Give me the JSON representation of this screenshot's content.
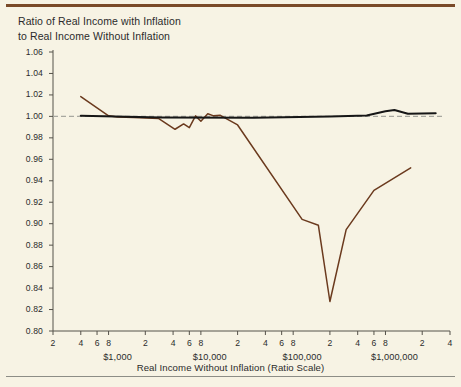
{
  "figure": {
    "title_line1": "Ratio of Real Income with Inflation",
    "title_line2": "to Real Income Without Inflation",
    "xaxis_title": "Real Income Without Inflation (Ratio Scale)",
    "top_rule_color": "#7a4a28",
    "bottom_rule_color": "#8d8d86",
    "background_color": "#f7f3e4"
  },
  "chart_data": {
    "type": "line",
    "title": "Ratio of Real Income with Inflation to Real Income Without Inflation",
    "xlabel": "Real Income Without Inflation (Ratio Scale)",
    "ylabel": "",
    "xscale": "log",
    "xlim": [
      200,
      4000000
    ],
    "ylim": [
      0.8,
      1.06
    ],
    "ygrid": false,
    "yticks": [
      "1.06",
      "1.04",
      "1.02",
      "1.00",
      "0.98",
      "0.96",
      "0.94",
      "0.92",
      "0.90",
      "0.88",
      "0.86",
      "0.84",
      "0.82",
      "0.80"
    ],
    "ytick_values": [
      1.06,
      1.04,
      1.02,
      1.0,
      0.98,
      0.96,
      0.94,
      0.92,
      0.9,
      0.88,
      0.86,
      0.84,
      0.82,
      0.8
    ],
    "xtick_labels": [
      "2",
      "4",
      "6",
      "8",
      "2",
      "4",
      "6",
      "8",
      "2",
      "4",
      "6",
      "8",
      "2",
      "4",
      "6",
      "8",
      "2",
      "4"
    ],
    "xtick_values": [
      200,
      400,
      600,
      800,
      2000,
      4000,
      6000,
      8000,
      20000,
      40000,
      60000,
      80000,
      200000,
      400000,
      600000,
      800000,
      2000000,
      4000000
    ],
    "decade_labels": [
      {
        "text": "$1,000",
        "value": 1000
      },
      {
        "text": "$10,000",
        "value": 10000
      },
      {
        "text": "$100,000",
        "value": 100000
      },
      {
        "text": "$1,000,000",
        "value": 1000000
      }
    ],
    "legend_position": "none",
    "reference_line": {
      "name": "unity-reference",
      "y": 1.0,
      "style": "dashed",
      "color": "#a8a8a0"
    },
    "series": [
      {
        "name": "Ratio with inflation (observed)",
        "color": "#6b3a1e",
        "style": "solid",
        "points": [
          {
            "x": 400,
            "y": 1.0185
          },
          {
            "x": 800,
            "y": 1.0005
          },
          {
            "x": 1000,
            "y": 0.9995
          },
          {
            "x": 1500,
            "y": 0.999
          },
          {
            "x": 2800,
            "y": 0.998
          },
          {
            "x": 4200,
            "y": 0.988
          },
          {
            "x": 5200,
            "y": 0.993
          },
          {
            "x": 6000,
            "y": 0.9895
          },
          {
            "x": 7000,
            "y": 1.0005
          },
          {
            "x": 8000,
            "y": 0.9955
          },
          {
            "x": 9500,
            "y": 1.0025
          },
          {
            "x": 11000,
            "y": 1.0005
          },
          {
            "x": 13000,
            "y": 1.001
          },
          {
            "x": 20000,
            "y": 0.992
          },
          {
            "x": 100000,
            "y": 0.904
          },
          {
            "x": 150000,
            "y": 0.8985
          },
          {
            "x": 200000,
            "y": 0.8275
          },
          {
            "x": 300000,
            "y": 0.8945
          },
          {
            "x": 600000,
            "y": 0.931
          },
          {
            "x": 1500000,
            "y": 0.952
          }
        ]
      },
      {
        "name": "Ratio without inflation (smooth)",
        "color": "#161616",
        "style": "solid",
        "points": [
          {
            "x": 400,
            "y": 1.0005
          },
          {
            "x": 3000,
            "y": 0.999
          },
          {
            "x": 30000,
            "y": 0.9988
          },
          {
            "x": 200000,
            "y": 0.9998
          },
          {
            "x": 500000,
            "y": 1.0008
          },
          {
            "x": 800000,
            "y": 1.0048
          },
          {
            "x": 1000000,
            "y": 1.006
          },
          {
            "x": 1400000,
            "y": 1.0025
          },
          {
            "x": 2800000,
            "y": 1.003
          }
        ]
      }
    ]
  }
}
